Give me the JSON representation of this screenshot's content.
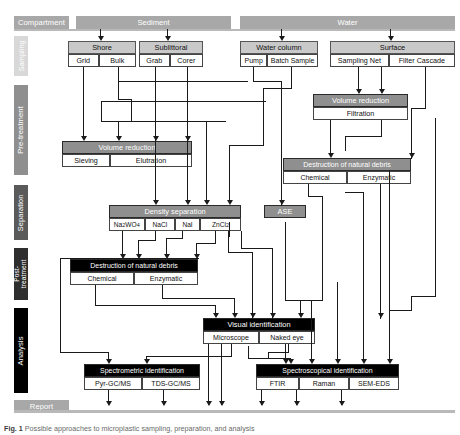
{
  "figure": {
    "caption_label": "Fig. 1",
    "caption_text": "Possible approaches to microplastic sampling, preparation, and analysis"
  },
  "stages": [
    {
      "name": "compartment",
      "label": "Compartment",
      "color": "#a8a8a8",
      "orientation": "horizontal"
    },
    {
      "name": "sampling",
      "label": "Sampling",
      "color": "#d8d8d8",
      "orientation": "vertical"
    },
    {
      "name": "pretreatment",
      "label": "Pre-treatment",
      "color": "#8f8f8f",
      "orientation": "vertical"
    },
    {
      "name": "separation",
      "label": "Separation",
      "color": "#5a5a5a",
      "orientation": "vertical"
    },
    {
      "name": "posttreatment",
      "label": "Post-\ntreatment",
      "label_line1": "Post-",
      "label_line2": "treatment",
      "color": "#2e2e2e",
      "orientation": "vertical"
    },
    {
      "name": "analysis",
      "label": "Analysis",
      "color": "#000000",
      "orientation": "vertical"
    },
    {
      "name": "report",
      "label": "Report",
      "color": "#a8a8a8",
      "orientation": "horizontal"
    }
  ],
  "compartments": [
    {
      "name": "sediment",
      "label": "Sediment"
    },
    {
      "name": "water",
      "label": "Water"
    }
  ],
  "sampling": [
    {
      "name": "shore",
      "title": "Shore",
      "methods": [
        "Grid",
        "Bulk"
      ]
    },
    {
      "name": "sublittoral",
      "title": "Sublittoral",
      "methods": [
        "Grab",
        "Corer"
      ]
    },
    {
      "name": "water-column",
      "title": "Water column",
      "methods": [
        "Pump",
        "Batch Sample"
      ]
    },
    {
      "name": "surface",
      "title": "Surface",
      "methods": [
        "Sampling Net",
        "Filter Cascade"
      ]
    }
  ],
  "pretreatment": [
    {
      "name": "volume-reduction-water",
      "title": "Volume reduction",
      "methods": [
        "Filtration"
      ]
    },
    {
      "name": "volume-reduction-sediment",
      "title": "Volume reduction",
      "methods": [
        "Sieving",
        "Elutration"
      ]
    },
    {
      "name": "destruction-natural-debris-pre",
      "title": "Destruction of natural debris",
      "methods": [
        "Chemical",
        "Enzymatic"
      ]
    }
  ],
  "separation": [
    {
      "name": "density-separation",
      "title": "Density separation",
      "methods": [
        "Na2WO4",
        "NaCl",
        "NaI",
        "ZnCl2"
      ],
      "methods_html": [
        "Na<sub>2</sub>WO<sub>4</sub>",
        "NaCl",
        "NaI",
        "ZnCl<sub>2</sub>"
      ]
    },
    {
      "name": "ase",
      "title": "ASE",
      "methods": []
    }
  ],
  "posttreatment": [
    {
      "name": "destruction-natural-debris-post",
      "title": "Destruction of natural debris",
      "methods": [
        "Chemical",
        "Enzymatic"
      ]
    }
  ],
  "analysis": [
    {
      "name": "visual-identification",
      "title": "Visual identification",
      "methods": [
        "Microscope",
        "Naked eye"
      ]
    },
    {
      "name": "spectrometric-identification",
      "title": "Spectrometric identification",
      "methods": [
        "Pyr-GC/MS",
        "TDS-GC/MS"
      ]
    },
    {
      "name": "spectroscopical-identification",
      "title": "Spectroscopical identification",
      "methods": [
        "FTIR",
        "Raman",
        "SEM-EDS"
      ]
    }
  ],
  "colors": {
    "line": "#1a1a1a",
    "box_border": "#444444",
    "header_gray": "#8f8f8f",
    "header_black": "#000000",
    "header_light": "#c9c9c9",
    "stage_compartment": "#a8a8a8",
    "stage_sampling": "#d8d8d8",
    "stage_pretreatment": "#8f8f8f",
    "stage_separation": "#5a5a5a",
    "stage_posttreatment": "#2e2e2e",
    "stage_analysis": "#000000",
    "stage_report": "#a8a8a8"
  }
}
